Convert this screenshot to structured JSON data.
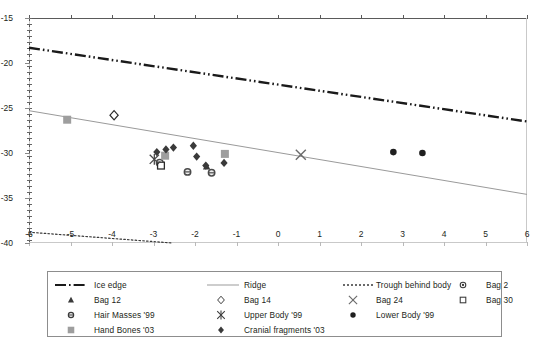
{
  "chart_data": {
    "type": "scatter",
    "title": "",
    "xlabel": "",
    "ylabel": "",
    "xlim": [
      -6,
      6
    ],
    "ylim": [
      -40,
      -15
    ],
    "xticks": [
      -6,
      -5,
      -4,
      -3,
      -2,
      -1,
      0,
      1,
      2,
      3,
      4,
      5,
      6
    ],
    "yticks": [
      -15,
      -20,
      -25,
      -30,
      -35,
      -40
    ],
    "grid": false,
    "legend_position": "bottom",
    "lines": [
      {
        "name": "Ice edge",
        "style": "dash-dot-dot",
        "color": "#1a1a1a",
        "width": 2.4,
        "points": [
          [
            -6,
            -18.3
          ],
          [
            6,
            -26.5
          ]
        ]
      },
      {
        "name": "Ridge",
        "style": "solid",
        "color": "#9a9a9a",
        "width": 1,
        "points": [
          [
            -6,
            -25.3
          ],
          [
            6,
            -34.6
          ]
        ]
      },
      {
        "name": "Trough behind body",
        "style": "dotted",
        "color": "#3a3a3a",
        "width": 1.2,
        "points": [
          [
            -6,
            -38.8
          ],
          [
            -2.55,
            -40.0
          ]
        ]
      }
    ],
    "series": [
      {
        "name": "Bag 2",
        "marker": "circle-dot",
        "color": "#4d4d4d",
        "points": [
          [
            -2.85,
            -31.1
          ]
        ]
      },
      {
        "name": "Bag 12",
        "marker": "triangle",
        "color": "#3a3a3a",
        "points": [
          [
            -1.72,
            -31.5
          ]
        ]
      },
      {
        "name": "Bag 14",
        "marker": "diamond-open",
        "color": "#2b2b2b",
        "points": [
          [
            -3.95,
            -25.8
          ]
        ]
      },
      {
        "name": "Bag 24",
        "marker": "x-thin",
        "color": "#6b6b6b",
        "points": [
          [
            0.55,
            -30.2
          ]
        ]
      },
      {
        "name": "Bag 30",
        "marker": "square-open",
        "color": "#2b2b2b",
        "points": [
          [
            -2.82,
            -31.4
          ]
        ]
      },
      {
        "name": "Hair Masses '99",
        "marker": "circle-small",
        "color": "#4a4a4a",
        "points": [
          [
            -2.18,
            -32.1
          ],
          [
            -1.6,
            -32.2
          ]
        ]
      },
      {
        "name": "Upper Body '99",
        "marker": "x-star",
        "color": "#4a4a4a",
        "points": [
          [
            -2.98,
            -30.7
          ]
        ]
      },
      {
        "name": "Lower Body '99",
        "marker": "circle-filled",
        "color": "#1f1f1f",
        "points": [
          [
            2.78,
            -29.9
          ],
          [
            3.48,
            -30.0
          ]
        ]
      },
      {
        "name": "Hand Bones '03",
        "marker": "square-gray",
        "color": "#9e9e9e",
        "points": [
          [
            -5.08,
            -26.3
          ],
          [
            -2.72,
            -30.3
          ],
          [
            -1.28,
            -30.1
          ]
        ]
      },
      {
        "name": "Cranial fragments '03",
        "marker": "diamond-filled",
        "color": "#3a3a3a",
        "points": [
          [
            -2.92,
            -29.9
          ],
          [
            -2.7,
            -29.6
          ],
          [
            -2.52,
            -29.4
          ],
          [
            -2.04,
            -29.2
          ],
          [
            -1.96,
            -30.4
          ],
          [
            -1.74,
            -31.4
          ],
          [
            -1.3,
            -31.1
          ]
        ]
      }
    ]
  },
  "axes": {
    "y_tick_labels": [
      "-15",
      "-20",
      "-25",
      "-30",
      "-35",
      "-40"
    ],
    "x_tick_labels": [
      "-6",
      "-5",
      "-4",
      "-3",
      "-2",
      "-1",
      "0",
      "1",
      "2",
      "3",
      "4",
      "5",
      "6"
    ]
  },
  "legend": {
    "rows": [
      [
        {
          "key": "line-dash-dot",
          "label": "Ice edge"
        },
        {
          "key": "line-solid-gray",
          "label": "Ridge"
        },
        {
          "key": "line-dotted",
          "label": "Trough behind body"
        },
        {
          "key": "circle-dot",
          "label": "Bag 2"
        }
      ],
      [
        {
          "key": "triangle",
          "label": "Bag 12"
        },
        {
          "key": "diamond-open",
          "label": "Bag 14"
        },
        {
          "key": "x-thin",
          "label": "Bag 24"
        },
        {
          "key": "square-open",
          "label": "Bag 30"
        }
      ],
      [
        {
          "key": "circle-small",
          "label": "Hair Masses '99"
        },
        {
          "key": "x-star",
          "label": "Upper Body '99"
        },
        {
          "key": "circle-filled",
          "label": "Lower Body '99"
        },
        {
          "key": "",
          "label": ""
        }
      ],
      [
        {
          "key": "square-gray",
          "label": "Hand Bones '03"
        },
        {
          "key": "diamond-filled",
          "label": "Cranial fragments '03"
        },
        {
          "key": "",
          "label": ""
        },
        {
          "key": "",
          "label": ""
        }
      ]
    ]
  },
  "colors": {
    "ink": "#231f20",
    "axis": "#8a8a8a",
    "ridge": "#9a9a9a",
    "ice_edge": "#1a1a1a",
    "gray_marker": "#9e9e9e"
  }
}
